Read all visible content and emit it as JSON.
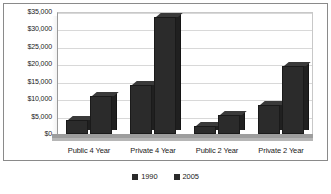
{
  "chart_data": {
    "type": "bar",
    "title": "",
    "subtitle": "",
    "xlabel": "",
    "ylabel": "",
    "categories": [
      "Public 4 Year",
      "Private 4 Year",
      "Public 2 Year",
      "Private 2 Year"
    ],
    "series": [
      {
        "name": "1990",
        "values": [
          4000,
          14000,
          2300,
          8300
        ],
        "color": "#2b2b2b"
      },
      {
        "name": "2005",
        "values": [
          11000,
          33500,
          5500,
          19500
        ],
        "color": "#2b2b2b"
      }
    ],
    "ylim": [
      0,
      35000
    ],
    "ytick_values": [
      0,
      5000,
      10000,
      15000,
      20000,
      25000,
      30000,
      35000
    ],
    "ytick_labels": [
      "$0",
      "$5,000",
      "$10,000",
      "$15,000",
      "$20,000",
      "$25,000",
      "$30,000",
      "$35,000"
    ],
    "grid": true,
    "grid_axis": "y",
    "legend_position": "bottom",
    "style": "3d-column",
    "colors": {
      "bar_face": "#2b2b2b",
      "bar_side": "#202020",
      "bar_top": "#3a3a3a",
      "gridline": "#d8d8d8",
      "axis": "#8f8f8f",
      "floor": "#9d9d9d",
      "frame": "#8a8a8a",
      "plot_background": "#ffffff",
      "text": "#1a1a1a"
    }
  }
}
